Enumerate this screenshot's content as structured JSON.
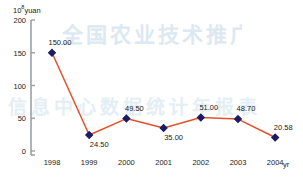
{
  "chart_data": {
    "type": "line",
    "title": "",
    "subtitle": "",
    "xlabel": "yr",
    "ylabel": "10⁸yuan",
    "categories": [
      "1998",
      "1999",
      "2000",
      "2001",
      "2002",
      "2003",
      "2004"
    ],
    "values": [
      150.0,
      24.5,
      49.5,
      35.0,
      51.0,
      48.7,
      20.58
    ],
    "point_labels": [
      "150.00",
      "24.50",
      "49.50",
      "35.00",
      "51.00",
      "48.70",
      "20.58"
    ],
    "label_positions": [
      "above",
      "below",
      "above",
      "below",
      "above",
      "above",
      "above"
    ],
    "ylim": [
      0,
      200
    ],
    "yticks": [
      0,
      50,
      100,
      150,
      200
    ],
    "ytick_labels": [
      "0",
      "50",
      "100",
      "150",
      "200"
    ],
    "grid": false,
    "legend": null,
    "series": [
      {
        "name": "",
        "values": [
          150.0,
          24.5,
          49.5,
          35.0,
          51.0,
          48.7,
          20.58
        ],
        "line_color": "#E8502A",
        "marker_color": "#1B1B64",
        "marker": "diamond"
      }
    ]
  },
  "axes": {
    "y_axis_color": "#9aa0a6",
    "y_unit_prefix": "10",
    "y_unit_exponent": "8",
    "y_unit_suffix": "yuan",
    "x_unit": "yr"
  },
  "watermark": {
    "line1": "全国农业技术推广服务",
    "line2": "信息中心数据统计年报表",
    "color": "#dce9f2"
  }
}
